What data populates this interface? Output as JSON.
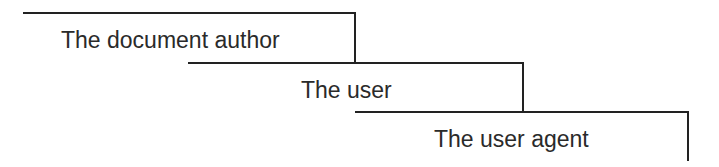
{
  "diagram": {
    "type": "cascade",
    "levels": [
      {
        "label": "The document author"
      },
      {
        "label": "The user"
      },
      {
        "label": "The user agent"
      }
    ],
    "colors": {
      "line": "#222222",
      "text": "#2a2a2a",
      "background": "#ffffff"
    }
  }
}
